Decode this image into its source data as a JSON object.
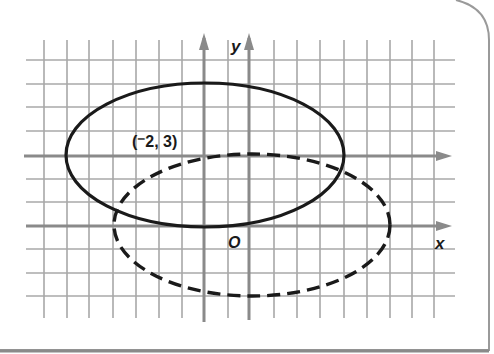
{
  "figure": {
    "type": "coordinate-graph",
    "colors": {
      "grid": "#a8a8a8",
      "axis": "#8a8a8a",
      "curve": "#1a1a1a",
      "frame": "#9a9a9a",
      "background": "#ffffff"
    },
    "labels": {
      "y_axis": "y",
      "x_axis": "x",
      "origin": "O",
      "point": "(⁻2, 3)"
    },
    "curves": [
      {
        "name": "original-ellipse",
        "style": "solid",
        "center": [
          -2,
          3
        ],
        "semi_axis_x": 6,
        "semi_axis_y": 3
      },
      {
        "name": "translated-ellipse",
        "style": "dashed",
        "center": [
          0,
          0
        ],
        "semi_axis_x": 6,
        "semi_axis_y": 3
      }
    ]
  }
}
